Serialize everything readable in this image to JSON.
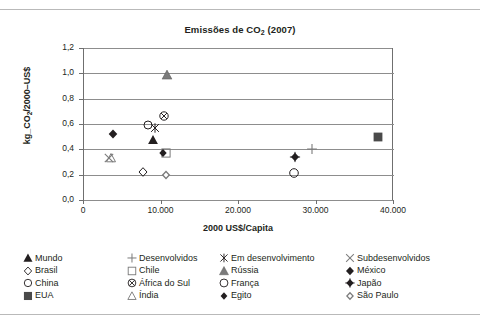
{
  "chart_data": {
    "type": "scatter",
    "title_main": "Emissões de CO",
    "title_sub": "2",
    "title_year": " (2007)",
    "xlabel": "2000 US$/Capita",
    "ylabel_main": "kg_CO",
    "ylabel_sub": "2",
    "ylabel_rest": "/2000–US$",
    "ylabel": "kg_CO₂/2000–US$",
    "xlim": [
      0,
      40000
    ],
    "ylim": [
      0.0,
      1.2
    ],
    "xticks": [
      0,
      10000,
      20000,
      30000,
      40000
    ],
    "xtick_labels": [
      "0",
      "10.000",
      "20.000",
      "30.000",
      "40.000"
    ],
    "yticks": [
      0.0,
      0.2,
      0.4,
      0.6,
      0.8,
      1.0,
      1.2
    ],
    "ytick_labels": [
      "0,0",
      "0,2",
      "0,4",
      "0,6",
      "0,8",
      "1,0",
      "1,2"
    ],
    "grid": "horizontal",
    "legend_position": "bottom",
    "points": [
      {
        "name": "Mundo",
        "marker": "triangle-filled",
        "x": 9000,
        "y": 0.47
      },
      {
        "name": "Desenvolvidos",
        "marker": "plus",
        "x": 29500,
        "y": 0.4
      },
      {
        "name": "Em desenvolvimento",
        "marker": "asterisk",
        "x": 9300,
        "y": 0.57
      },
      {
        "name": "Subdesenvolvidos",
        "marker": "cross",
        "x": 3300,
        "y": 0.335
      },
      {
        "name": "Brasil",
        "marker": "diamond-open",
        "x": 7700,
        "y": 0.22
      },
      {
        "name": "Chile",
        "marker": "square-open",
        "x": 10700,
        "y": 0.37
      },
      {
        "name": "Rússia",
        "marker": "triangle-gray",
        "x": 10800,
        "y": 0.99
      },
      {
        "name": "México",
        "marker": "diamond-filled",
        "x": 3900,
        "y": 0.52
      },
      {
        "name": "China",
        "marker": "circle-open",
        "x": 8400,
        "y": 0.59
      },
      {
        "name": "África do Sul",
        "marker": "circle-cross",
        "x": 10500,
        "y": 0.665
      },
      {
        "name": "França",
        "marker": "circle-open-large",
        "x": 27200,
        "y": 0.21
      },
      {
        "name": "Japão",
        "marker": "diamond-plus",
        "x": 27300,
        "y": 0.34
      },
      {
        "name": "EUA",
        "marker": "square-filled",
        "x": 38000,
        "y": 0.5
      },
      {
        "name": "Índia",
        "marker": "triangle-open",
        "x": 3600,
        "y": 0.33
      },
      {
        "name": "Egito",
        "marker": "diamond-filled-small",
        "x": 10300,
        "y": 0.375
      },
      {
        "name": "São Paulo",
        "marker": "diamond-double",
        "x": 10700,
        "y": 0.195
      }
    ],
    "legend_columns": [
      [
        {
          "label": "Mundo",
          "marker": "triangle-filled"
        },
        {
          "label": "Brasil",
          "marker": "diamond-open"
        },
        {
          "label": "China",
          "marker": "circle-open"
        },
        {
          "label": "EUA",
          "marker": "square-filled"
        }
      ],
      [
        {
          "label": "Desenvolvidos",
          "marker": "plus"
        },
        {
          "label": "Chile",
          "marker": "square-open"
        },
        {
          "label": "África do Sul",
          "marker": "circle-cross"
        },
        {
          "label": "Índia",
          "marker": "triangle-open"
        }
      ],
      [
        {
          "label": "Em desenvolvimento",
          "marker": "asterisk"
        },
        {
          "label": "Rússia",
          "marker": "triangle-gray"
        },
        {
          "label": "França",
          "marker": "circle-open-large"
        },
        {
          "label": "Egito",
          "marker": "diamond-filled-small"
        }
      ],
      [
        {
          "label": "Subdesenvolvidos",
          "marker": "cross"
        },
        {
          "label": "México",
          "marker": "diamond-filled"
        },
        {
          "label": "Japão",
          "marker": "diamond-plus"
        },
        {
          "label": "São Paulo",
          "marker": "diamond-double"
        }
      ]
    ],
    "colors": {
      "text": "#231f20",
      "axis": "#6f6f6f",
      "grid": "#8d8d8d",
      "marker_dark": "#231f20",
      "marker_gray": "#7b7b7b",
      "background": "#ffffff"
    }
  }
}
